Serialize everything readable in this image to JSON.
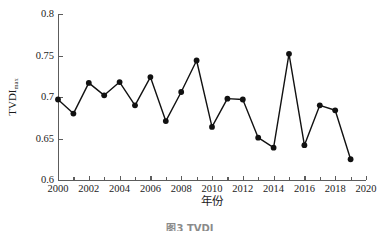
{
  "chart_data": {
    "type": "line",
    "title": "",
    "xlabel": "年份",
    "ylabel": "TVDI",
    "ylabel_sub": "max",
    "x": [
      2000,
      2001,
      2002,
      2003,
      2004,
      2005,
      2006,
      2007,
      2008,
      2009,
      2010,
      2011,
      2012,
      2013,
      2014,
      2015,
      2016,
      2017,
      2018,
      2019
    ],
    "values": [
      0.697,
      0.68,
      0.717,
      0.702,
      0.718,
      0.69,
      0.724,
      0.671,
      0.706,
      0.744,
      0.664,
      0.698,
      0.697,
      0.651,
      0.639,
      0.752,
      0.642,
      0.69,
      0.684,
      0.625
    ],
    "xlim": [
      2000,
      2020
    ],
    "ylim": [
      0.6,
      0.8
    ],
    "xticks": [
      2000,
      2002,
      2004,
      2006,
      2008,
      2010,
      2012,
      2014,
      2016,
      2018,
      2020
    ],
    "xtick_labels": [
      "2000",
      "2002",
      "2004",
      "2006",
      "2008",
      "2010",
      "2012",
      "2014",
      "2016",
      "2018",
      "2020"
    ],
    "xticks_minor": [
      2001,
      2003,
      2005,
      2007,
      2009,
      2011,
      2013,
      2015,
      2017,
      2019
    ],
    "yticks": [
      0.6,
      0.65,
      0.7,
      0.75,
      0.8
    ],
    "ytick_labels": [
      "0.6",
      "0.65",
      "0.7",
      "0.75",
      "0.8"
    ],
    "grid": false,
    "legend": null,
    "marker": "filled-circle",
    "marker_color": "#111111",
    "line_color": "#111111",
    "axis_color": "#5c5c5c"
  },
  "caption": {
    "text": "图3 TVDI"
  }
}
